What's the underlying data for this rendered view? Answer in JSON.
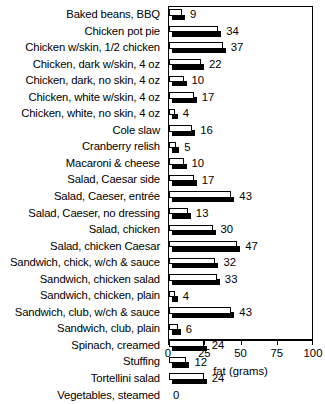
{
  "chart_data": {
    "type": "bar",
    "orientation": "horizontal",
    "title": "",
    "xlabel": "fat (grams)",
    "ylabel": "",
    "xlim": [
      0,
      100
    ],
    "xticks": [
      0,
      25,
      50,
      75,
      100
    ],
    "xtick_labels": [
      "0",
      "25",
      "50",
      "75",
      "100"
    ],
    "grid": false,
    "legend": false,
    "bar_style": "3d-block-white-top-black-front",
    "value_labels_shown": true,
    "categories": [
      "Baked beans, BBQ",
      "Chicken pot pie",
      "Chicken w/skin, 1/2 chicken",
      "Chicken, dark w/skin, 4 oz",
      "Chicken, dark, no skin, 4 oz",
      "Chicken, white w/skin, 4 oz",
      "Chicken, white, no skin, 4 oz",
      "Cole slaw",
      "Cranberry relish",
      "Macaroni & cheese",
      "Salad, Caesar side",
      "Salad, Caeser, entrée",
      "Salad, Caeser, no dressing",
      "Salad, chicken",
      "Salad, chicken Caesar",
      "Sandwich, chick, w/ch & sauce",
      "Sandwich, chicken salad",
      "Sandwich, chicken, plain",
      "Sandwich, club, w/ch & sauce",
      "Sandwich, club, plain",
      "Spinach, creamed",
      "Stuffing",
      "Tortellini salad",
      "Vegetables, steamed"
    ],
    "values": [
      9,
      34,
      37,
      22,
      10,
      17,
      4,
      16,
      5,
      10,
      17,
      43,
      13,
      30,
      47,
      32,
      33,
      4,
      43,
      6,
      24,
      12,
      24,
      0
    ],
    "value_label_texts": [
      "9",
      "34",
      "37",
      "22",
      "10",
      "17",
      "4",
      "16",
      "5",
      "10",
      "17",
      "43",
      "13",
      "30",
      "47",
      "32",
      "33",
      "4",
      "43",
      "6",
      "24",
      "12",
      "24",
      "0"
    ]
  },
  "colors": {
    "bar_top_face": "#ffffff",
    "bar_front_face": "#000000",
    "outline": "#000000",
    "background": "#ffffff",
    "text": "#000000"
  }
}
